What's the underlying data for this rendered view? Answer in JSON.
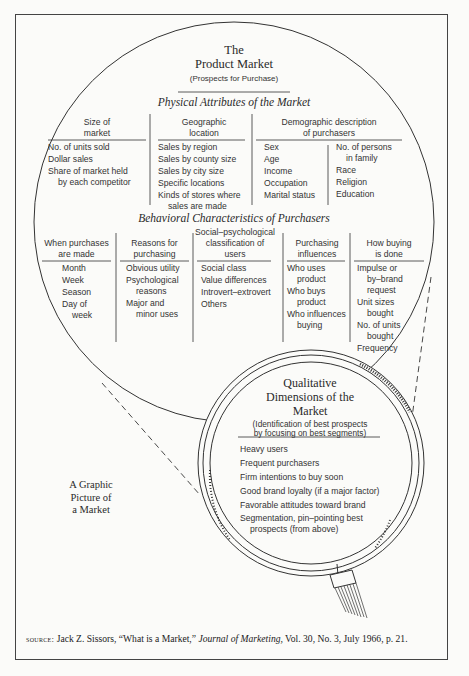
{
  "product_market": {
    "title_line1": "The",
    "title_line2": "Product Market",
    "subtitle": "(Prospects for Purchase)"
  },
  "physical": {
    "heading": "Physical Attributes of the Market",
    "columns": [
      {
        "header": [
          "Size of",
          "market"
        ],
        "items": [
          "No. of units sold",
          "Dollar sales",
          "Share of market held",
          "by each competitor"
        ]
      },
      {
        "header": [
          "Geographic",
          "location"
        ],
        "items": [
          "Sales by region",
          "Sales by county size",
          "Sales by city size",
          "Specific locations",
          "Kinds of stores where",
          "sales are made"
        ]
      },
      {
        "header": [
          "Demographic description",
          "of purchasers"
        ],
        "items_left": [
          "Sex",
          "Age",
          "Income",
          "Occupation",
          "Marital status"
        ],
        "items_right": [
          "No. of persons",
          "in family",
          "Race",
          "Religion",
          "Education"
        ]
      }
    ]
  },
  "behavioral": {
    "heading": "Behavioral Characteristics of Purchasers",
    "columns": [
      {
        "header": [
          "When purchases",
          "are made"
        ],
        "items": [
          "Month",
          "Week",
          "Season",
          "Day of",
          "week"
        ]
      },
      {
        "header": [
          "Reasons for",
          "purchasing"
        ],
        "items": [
          "Obvious utility",
          "Psychological",
          "reasons",
          "Major and",
          "minor uses"
        ]
      },
      {
        "header": [
          "Social–psychological",
          "classification of",
          "users"
        ],
        "items": [
          "Social class",
          "Value differences",
          "Introvert–extrovert",
          "Others"
        ]
      },
      {
        "header": [
          "Purchasing",
          "influences"
        ],
        "items": [
          "Who uses",
          "product",
          "Who buys",
          "product",
          "Who influences",
          "buying"
        ]
      },
      {
        "header": [
          "How buying",
          "is done"
        ],
        "items": [
          "Impulse or",
          "by–brand",
          "request",
          "Unit sizes",
          "bought",
          "No. of units",
          "bought",
          "Frequency"
        ]
      }
    ]
  },
  "qualitative": {
    "title_line1": "Qualitative",
    "title_line2": "Dimensions of the",
    "title_line3": "Market",
    "subtitle_line1": "(Identification of best prospects",
    "subtitle_line2": "by focusing on best segments)",
    "items": [
      "Heavy users",
      "Frequent purchasers",
      "Firm intentions to buy soon",
      "Good brand loyalty (if a major factor)",
      "Favorable attitudes toward brand",
      "Segmentation, pin–pointing best",
      "prospects (from above)"
    ]
  },
  "side_label": [
    "A Graphic",
    "Picture of",
    "a Market"
  ],
  "source": {
    "label": "source:",
    "text_before": " Jack Z. Sissors, “What is a Market,” ",
    "journal": "Journal of Marketing,",
    "text_after": " Vol. 30, No. 3, July 1966, p. 21."
  }
}
